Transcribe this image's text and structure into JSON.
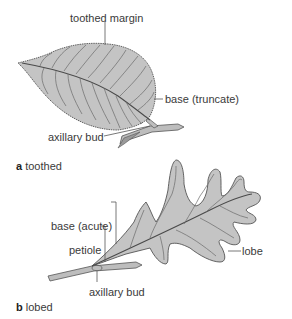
{
  "colors": {
    "leaf_fill": "#c4c4c4",
    "vein": "#555555",
    "outline": "#555555",
    "text": "#3a3a3a"
  },
  "panel_a": {
    "caption_letter": "a",
    "caption_text": "toothed",
    "labels": {
      "toothed_margin": "toothed margin",
      "base": "base (truncate)",
      "axillary_bud": "axillary bud"
    }
  },
  "panel_b": {
    "caption_letter": "b",
    "caption_text": "lobed",
    "labels": {
      "base": "base (acute)",
      "petiole": "petiole",
      "lobe": "lobe",
      "axillary_bud": "axillary bud"
    }
  }
}
